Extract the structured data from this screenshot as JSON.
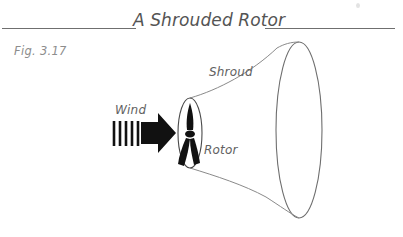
{
  "figure": {
    "title": "A Shrouded Rotor",
    "caption_label": "Fig. 3.17",
    "background_color": "#ffffff",
    "rule_color": "#6f6f6f",
    "title_color": "#545454",
    "caption_color": "#8d8d8d",
    "annotation_color": "#616161",
    "line_color": "#707070",
    "blade_color": "#111111"
  },
  "annotations": {
    "wind": "Wind",
    "shroud": "Shroud",
    "rotor": "Rotor"
  },
  "diagram": {
    "type": "technical-illustration",
    "components": [
      {
        "name": "rotor-disc",
        "shape": "ellipse",
        "center_x": 190,
        "center_y": 133,
        "radius_x": 12,
        "radius_y": 35
      },
      {
        "name": "shroud-outlet",
        "shape": "ellipse",
        "center_x": 299,
        "center_y": 130,
        "radius_x": 23,
        "radius_y": 88
      },
      {
        "name": "shroud-upper-wall",
        "shape": "curve",
        "from": [
          190,
          98
        ],
        "to": [
          299,
          42
        ]
      },
      {
        "name": "shroud-lower-wall",
        "shape": "curve",
        "from": [
          190,
          168
        ],
        "to": [
          299,
          218
        ]
      },
      {
        "name": "rotor-blades",
        "count": 3,
        "hub_x": 190,
        "hub_y": 133
      },
      {
        "name": "wind-arrow",
        "stripe_count": 5,
        "tip_x": 175,
        "tip_y": 133
      }
    ]
  }
}
